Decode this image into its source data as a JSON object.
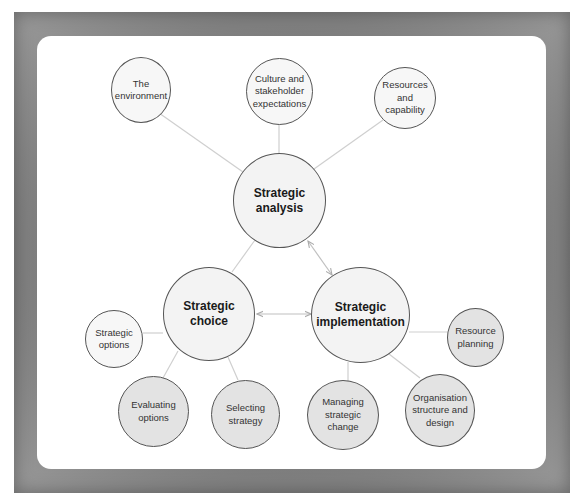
{
  "diagram": {
    "title": "",
    "main_nodes": {
      "analysis": {
        "label": "Strategic\nanalysis"
      },
      "choice": {
        "label": "Strategic\nchoice"
      },
      "implementation": {
        "label": "Strategic\nimplementation"
      }
    },
    "analysis_children": [
      {
        "label": "The\nenvironment"
      },
      {
        "label": "Culture and\nstakeholder\nexpectations"
      },
      {
        "label": "Resources\nand\ncapability"
      }
    ],
    "choice_children": [
      {
        "label": "Strategic\noptions"
      },
      {
        "label": "Evaluating\noptions"
      },
      {
        "label": "Selecting\nstrategy"
      }
    ],
    "implementation_children": [
      {
        "label": "Resource\nplanning"
      },
      {
        "label": "Managing\nstrategic\nchange"
      },
      {
        "label": "Organisation\nstructure and\ndesign"
      }
    ],
    "connections": [
      {
        "from": "Strategic analysis",
        "to": "Strategic choice",
        "type": "line"
      },
      {
        "from": "Strategic analysis",
        "to": "Strategic implementation",
        "type": "double-arrow"
      },
      {
        "from": "Strategic choice",
        "to": "Strategic implementation",
        "type": "double-arrow"
      }
    ],
    "colors": {
      "frame": "#777777",
      "panel": "#ffffff",
      "main_fill": "#f3f3f3",
      "outer_fill": "#f7f7f7",
      "shaded_fill": "#e3e3e3",
      "stroke": "#555555",
      "connector": "#c8c8c8"
    }
  }
}
